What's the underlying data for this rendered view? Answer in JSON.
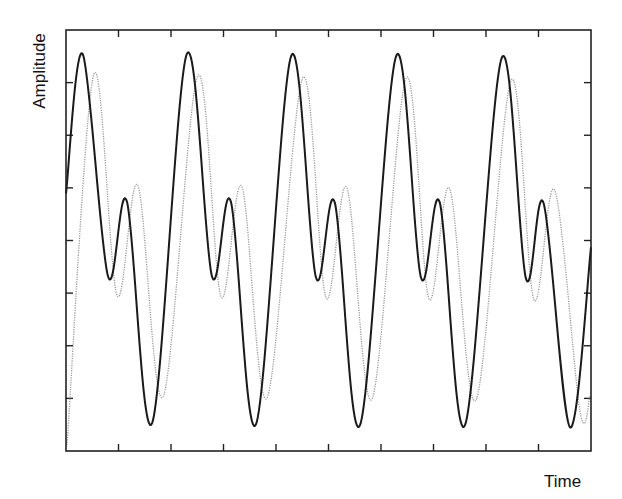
{
  "chart_data": {
    "type": "line",
    "title": "",
    "xlabel": "Time",
    "ylabel": "Amplitude",
    "xlim": [
      0,
      10
    ],
    "ylim": [
      0,
      8
    ],
    "x_ticks_count": 9,
    "y_ticks_count": 7,
    "tick_labels": false,
    "grid": false,
    "legend": null,
    "series": [
      {
        "name": "signal-solid",
        "style": "solid",
        "color": "#1a1a1a",
        "points": [
          [
            0.0,
            4.89
          ],
          [
            0.32,
            7.54
          ],
          [
            0.8,
            3.32
          ],
          [
            1.16,
            4.74
          ],
          [
            1.64,
            0.53
          ],
          [
            2.3,
            7.54
          ],
          [
            2.78,
            3.32
          ],
          [
            3.14,
            4.74
          ],
          [
            3.62,
            0.51
          ],
          [
            4.29,
            7.51
          ],
          [
            4.76,
            3.3
          ],
          [
            5.12,
            4.72
          ],
          [
            5.6,
            0.49
          ],
          [
            6.29,
            7.51
          ],
          [
            6.76,
            3.3
          ],
          [
            7.12,
            4.72
          ],
          [
            7.6,
            0.49
          ],
          [
            8.3,
            7.47
          ],
          [
            8.76,
            3.28
          ],
          [
            9.1,
            4.7
          ],
          [
            9.6,
            0.45
          ],
          [
            10.0,
            3.87
          ]
        ]
      },
      {
        "name": "signal-dotted",
        "style": "dotted",
        "color": "#9a9a9a",
        "points": [
          [
            0.02,
            0.11
          ],
          [
            0.53,
            7.16
          ],
          [
            0.97,
            2.96
          ],
          [
            1.37,
            5.04
          ],
          [
            1.85,
            1.03
          ],
          [
            2.51,
            7.13
          ],
          [
            2.95,
            2.94
          ],
          [
            3.35,
            5.02
          ],
          [
            3.83,
            1.01
          ],
          [
            4.51,
            7.09
          ],
          [
            4.95,
            2.92
          ],
          [
            5.35,
            5.0
          ],
          [
            5.83,
            0.99
          ],
          [
            6.48,
            7.09
          ],
          [
            6.91,
            2.9
          ],
          [
            7.31,
            4.98
          ],
          [
            7.81,
            0.97
          ],
          [
            8.48,
            7.05
          ],
          [
            8.91,
            2.88
          ],
          [
            9.31,
            4.95
          ],
          [
            9.79,
            0.76
          ],
          [
            9.98,
            1.04
          ]
        ]
      }
    ]
  }
}
